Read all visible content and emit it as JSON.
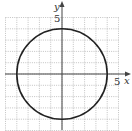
{
  "chart_data": {
    "type": "line",
    "title": "",
    "xlabel": "x",
    "ylabel": "y",
    "x_tick_label": "5",
    "y_tick_label": "5",
    "xlim": [
      -5,
      5
    ],
    "ylim": [
      -5,
      5
    ],
    "grid": true,
    "grid_style": "dotted",
    "series": [
      {
        "name": "circle",
        "shape": "circle",
        "center": [
          0,
          0
        ],
        "radius": 4,
        "equation": "x^2 + y^2 = 16"
      }
    ]
  },
  "labels": {
    "x_axis": "x",
    "y_axis": "y",
    "x_tick": "5",
    "y_tick": "5"
  },
  "colors": {
    "grid": "#9a9a9a",
    "axis": "#444444",
    "curve": "#222222"
  }
}
